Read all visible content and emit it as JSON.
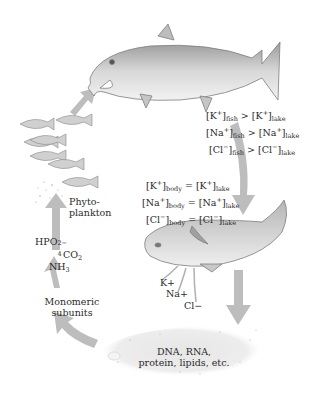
{
  "diagram": {
    "type": "cycle",
    "colors": {
      "arrow": "#b8b8b8",
      "fish_body": "#d9d9d9",
      "fish_outline": "#8a8a8a",
      "text": "#2a2a2a"
    },
    "labels": {
      "fish_vs_lake": [
        {
          "ion": "[K",
          "charge": "+",
          "sub1": "fish",
          "op": " > ",
          "ion2": "[K",
          "charge2": "+",
          "sub2": "lake"
        },
        {
          "ion": "[Na",
          "charge": "+",
          "sub1": "fish",
          "op": " > ",
          "ion2": "[Na",
          "charge2": "+",
          "sub2": "lake"
        },
        {
          "ion": "[Cl",
          "charge": "−",
          "sub1": "fish",
          "op": " > ",
          "ion2": "[Cl",
          "charge2": "−",
          "sub2": "lake"
        }
      ],
      "body_vs_lake": [
        {
          "ion": "[K",
          "charge": "+",
          "sub1": "body",
          "op": " = ",
          "ion2": "[K",
          "charge2": "+",
          "sub2": "lake"
        },
        {
          "ion": "[Na",
          "charge": "+",
          "sub1": "body",
          "op": " = ",
          "ion2": "[Na",
          "charge2": "+",
          "sub2": "lake"
        },
        {
          "ion": "[Cl",
          "charge": "−",
          "sub1": "body",
          "op": " = ",
          "ion2": "[Cl",
          "charge2": "−",
          "sub2": "lake"
        }
      ],
      "released_ions": [
        "K+",
        "Na+",
        "Cl−"
      ],
      "phytoplankton": [
        "Phyto-",
        "plankton"
      ],
      "nutrients": {
        "hpo4": "HPO",
        "hpo4_sub": "4",
        "hpo4_sup": "2−",
        "co2": "CO",
        "co2_sub": "2",
        "nh3": "NH",
        "nh3_sub": "3"
      },
      "monomeric": [
        "Monomeric",
        "subunits"
      ],
      "macromolecules": [
        "DNA, RNA,",
        "protein, lipids, etc."
      ]
    }
  }
}
